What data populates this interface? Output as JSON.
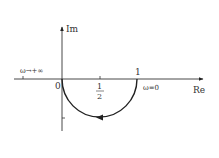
{
  "diagram": {
    "type": "nyquist-plot",
    "axes": {
      "x_label": "Re",
      "y_label": "Im"
    },
    "labels": {
      "origin": "0",
      "one": "1",
      "half_num": "1",
      "half_den": "2",
      "omega_zero": "ω=0",
      "omega_inf": "ω→+∞"
    },
    "curve": {
      "shape": "lower semicircle",
      "center": [
        0.5,
        0
      ],
      "radius": 0.5,
      "start": "ω=0 at (1,0)",
      "end": "ω→+∞ at (0,0)",
      "direction": "clockwise from 1 to 0 through lower half-plane"
    },
    "colors": {
      "line": "#222222",
      "text": "#333333",
      "background": "#ffffff"
    }
  }
}
